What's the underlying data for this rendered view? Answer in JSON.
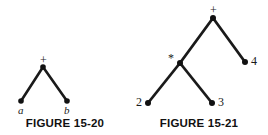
{
  "plate": {
    "background_color": "#ffffff",
    "ink_color": "#1a1a1a",
    "width": 268,
    "height": 135
  },
  "figures": [
    {
      "id": "figure-15-20",
      "caption": "FIGURE 15-20",
      "description": "Binary expression tree for a + b",
      "expression": "a + b",
      "nodes": [
        {
          "id": "root",
          "label": "+",
          "kind": "operator",
          "x": 43,
          "y": 67,
          "label_x": 43,
          "label_y": 54,
          "label_anchor": "above"
        },
        {
          "id": "left",
          "label": "a",
          "kind": "operand",
          "x": 21,
          "y": 101,
          "label_x": 21,
          "label_y": 104,
          "label_anchor": "below"
        },
        {
          "id": "right",
          "label": "b",
          "kind": "operand",
          "x": 67,
          "y": 101,
          "label_x": 67,
          "label_y": 104,
          "label_anchor": "below"
        }
      ],
      "edges": [
        {
          "from": "root",
          "to": "left"
        },
        {
          "from": "root",
          "to": "right"
        }
      ]
    },
    {
      "id": "figure-15-21",
      "caption": "FIGURE 15-21",
      "description": "Binary expression tree for 2 * 3 + 4",
      "expression": "2 * 3 + 4",
      "nodes": [
        {
          "id": "root",
          "label": "+",
          "kind": "operator",
          "x": 83,
          "y": 18,
          "label_x": 83,
          "label_y": 4,
          "label_anchor": "above"
        },
        {
          "id": "mul",
          "label": "*",
          "kind": "operator",
          "x": 50,
          "y": 63,
          "label_x": 41,
          "label_y": 55,
          "label_anchor": "upper-left"
        },
        {
          "id": "two",
          "label": "2",
          "kind": "operand",
          "x": 18,
          "y": 103,
          "label_x": 7,
          "label_y": 98,
          "label_anchor": "left"
        },
        {
          "id": "three",
          "label": "3",
          "kind": "operand",
          "x": 82,
          "y": 103,
          "label_x": 88,
          "label_y": 98,
          "label_anchor": "right"
        },
        {
          "id": "four",
          "label": "4",
          "kind": "operand",
          "x": 115,
          "y": 62,
          "label_x": 121,
          "label_y": 57,
          "label_anchor": "right"
        }
      ],
      "edges": [
        {
          "from": "root",
          "to": "mul"
        },
        {
          "from": "root",
          "to": "four"
        },
        {
          "from": "mul",
          "to": "two"
        },
        {
          "from": "mul",
          "to": "three"
        }
      ]
    }
  ]
}
